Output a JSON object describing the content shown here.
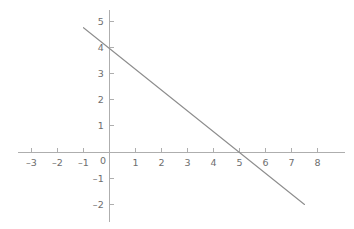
{
  "chart_data": {
    "type": "line",
    "title": "",
    "xlabel": "",
    "ylabel": "",
    "xlim": [
      -3.6,
      8.6
    ],
    "ylim": [
      -2.5,
      5.5
    ],
    "grid": false,
    "legend": null,
    "axis_style": "cartesian-cross",
    "x_ticks": [
      -3,
      -2,
      -1,
      0,
      1,
      2,
      3,
      4,
      5,
      6,
      7,
      8
    ],
    "x_tick_labels": [
      "–3",
      "–2",
      "–1",
      "0",
      "1",
      "2",
      "3",
      "4",
      "5",
      "6",
      "7",
      "8"
    ],
    "y_ticks": [
      -2,
      -1,
      0,
      1,
      2,
      3,
      4,
      5
    ],
    "y_tick_labels": [
      "–2",
      "–1",
      "0",
      "1",
      "2",
      "3",
      "4",
      "5"
    ],
    "series": [
      {
        "name": "line",
        "equation": "y = 4 - 0.8x",
        "slope": -0.8,
        "intercept": 4,
        "x_intercept": 5,
        "y_intercept": 4,
        "color": "#8d8d8d",
        "width": 1.1,
        "x": [
          -1,
          7.5
        ],
        "values": [
          4.8,
          -2
        ]
      }
    ],
    "annotations": []
  },
  "axes": {
    "color": "#aeaeae",
    "tick_color": "#aeaeae",
    "label_color": "#6e6e6e",
    "x_axis_label_text": "",
    "y_axis_label_text": ""
  },
  "figure": {
    "background": "#ffffff",
    "width": 354,
    "height": 229
  }
}
